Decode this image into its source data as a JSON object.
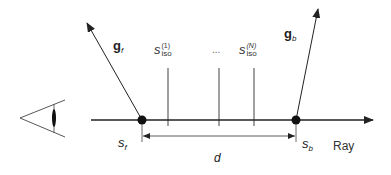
{
  "diagram": {
    "colors": {
      "line": "#222222",
      "iso_line": "#a0a0a0",
      "text": "#222222"
    },
    "labels": {
      "g_front": {
        "base": "g",
        "sub": "f"
      },
      "g_back": {
        "base": "g",
        "sub": "b"
      },
      "iso_first": {
        "base": "s",
        "sub": "iso",
        "sup": "(1)"
      },
      "iso_ellipsis": "...",
      "iso_last": {
        "base": "s",
        "sub": "iso",
        "sup": "(N)"
      },
      "s_front": {
        "base": "s",
        "sub": "f"
      },
      "s_back": {
        "base": "s",
        "sub": "b"
      },
      "distance": "d",
      "ray": "Ray"
    }
  }
}
